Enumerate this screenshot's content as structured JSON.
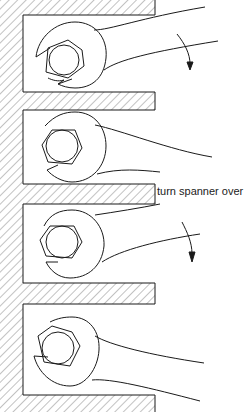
{
  "diagram": {
    "steps": [
      {
        "name": "step-1",
        "description": "spanner on nut, rotate downward",
        "arrow": true
      },
      {
        "name": "step-2",
        "description": "spanner at end of swing",
        "arrow": false
      },
      {
        "name": "step-3",
        "description": "spanner turned over, rotate downward",
        "arrow": true
      },
      {
        "name": "step-4",
        "description": "spanner at end of swing",
        "arrow": false
      }
    ],
    "annotation": "turn spanner over",
    "colors": {
      "line": "#1a1a1a",
      "hatch": "#555555",
      "background": "#ffffff"
    }
  }
}
